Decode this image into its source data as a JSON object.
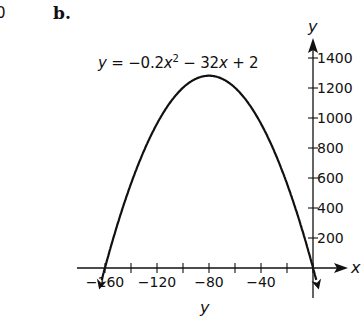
{
  "fragment": {
    "previous_part_digit": "0"
  },
  "part_label": "b.",
  "equation": {
    "lhs": "y",
    "eq": " = −0.2",
    "var1": "x",
    "exp": "2",
    "rest1": " − 32",
    "var2": "x",
    "rest2": " + 2"
  },
  "axes": {
    "x_label": "x",
    "y_label_top": "y",
    "y_label_bottom": "y"
  },
  "chart_data": {
    "type": "line",
    "xlabel": "x",
    "ylabel": "y",
    "function": "y = -0.2*x^2 - 32*x + 2",
    "x": [
      -160,
      -140,
      -120,
      -100,
      -80,
      -60,
      -40,
      -20,
      0
    ],
    "values": [
      2,
      562,
      962,
      1202,
      1282,
      1202,
      962,
      562,
      2
    ],
    "xlim": [
      -170,
      20
    ],
    "ylim": [
      -150,
      1500
    ],
    "x_ticks": [
      -160,
      -140,
      -120,
      -100,
      -80,
      -60,
      -40,
      -20,
      0
    ],
    "x_tick_labels": [
      "−160",
      "−120",
      "−80",
      "−40"
    ],
    "y_ticks": [
      200,
      400,
      600,
      800,
      1000,
      1200,
      1400
    ],
    "y_tick_labels": [
      "200",
      "400",
      "600",
      "800",
      "1000",
      "1200",
      "1400"
    ],
    "vertex": {
      "x": -80,
      "y": 1282
    },
    "grid": false,
    "arrows_on_curve_ends": true
  }
}
